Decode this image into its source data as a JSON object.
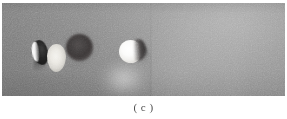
{
  "figure": {
    "caption": "( c )",
    "panel_label": "c",
    "panel_alt": "grayscale image panel",
    "colors": {
      "background": "#ffffff",
      "field_gray": "#8d8d8d",
      "dark_feature": "#3a3636",
      "bright_feature": "#ffffff",
      "caption_text": "#4e4e4e"
    },
    "panel": {
      "x": 2,
      "y": 3,
      "width": 283,
      "height": 93
    },
    "features": [
      {
        "name": "dark-teardrop-with-bright-edge",
        "tone": "dark",
        "x": 31,
        "y": 37,
        "width": 15,
        "height": 25
      },
      {
        "name": "light-oval",
        "tone": "light",
        "x": 45,
        "y": 41,
        "width": 19,
        "height": 28
      },
      {
        "name": "dark-round-disc",
        "tone": "dark",
        "x": 64,
        "y": 31,
        "width": 27,
        "height": 27
      },
      {
        "name": "bright-disc-with-dark-crescent",
        "tone": "bright",
        "x": 117,
        "y": 37,
        "width": 23,
        "height": 23
      },
      {
        "name": "diffuse-lower-glow",
        "tone": "bright",
        "x": 96,
        "y": 56,
        "width": 56,
        "height": 44
      }
    ]
  }
}
